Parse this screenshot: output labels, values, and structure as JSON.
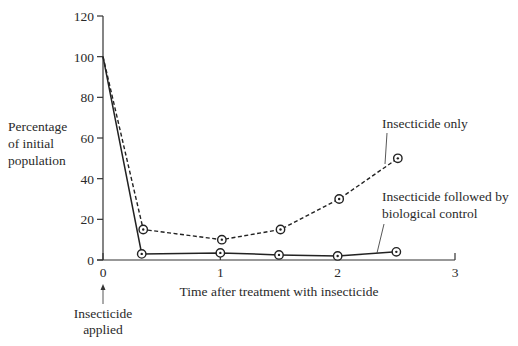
{
  "chart_data": {
    "type": "line",
    "title": "",
    "xlabel": "Time after treatment with insecticide",
    "ylabel": "Percentage of initial population",
    "ylabel_lines": [
      "Percentage",
      "of initial",
      "population"
    ],
    "xlim": [
      0,
      3
    ],
    "ylim": [
      0,
      120
    ],
    "x_ticks": [
      "0",
      "1",
      "2",
      "3"
    ],
    "y_ticks": [
      "0",
      "20",
      "40",
      "60",
      "80",
      "100",
      "120"
    ],
    "grid": false,
    "legend": "inline labels with leader lines",
    "series": [
      {
        "name": "Insecticide only",
        "style": "dashed",
        "x": [
          0,
          0.33,
          1,
          1.5,
          2,
          2.5
        ],
        "values": [
          100,
          15,
          10,
          15,
          30,
          50
        ],
        "label_lines": [
          "Insecticide only"
        ]
      },
      {
        "name": "Insecticide followed by biological control",
        "style": "solid",
        "x": [
          0,
          0.33,
          1,
          1.5,
          2,
          2.5
        ],
        "values": [
          100,
          3,
          3.5,
          2.5,
          2,
          4
        ],
        "label_lines": [
          "Insecticide followed by",
          "biological control"
        ]
      }
    ],
    "annotations": [
      {
        "text_lines": [
          "Insecticide",
          "applied"
        ],
        "x": 0,
        "arrow": "up"
      }
    ]
  }
}
